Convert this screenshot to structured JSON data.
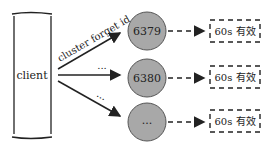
{
  "client": {
    "label": "client"
  },
  "arrows": [
    {
      "label": "cluster forget id"
    },
    {
      "label": "..."
    },
    {
      "label": "..."
    }
  ],
  "nodes": [
    {
      "label": "6379"
    },
    {
      "label": "6380"
    },
    {
      "label": "..."
    }
  ],
  "notes": [
    {
      "label": "60s 有效"
    },
    {
      "label": "60s 有效"
    },
    {
      "label": "60s 有效"
    }
  ],
  "colors": {
    "node_fill": "#a8a8a8",
    "node_stroke": "#555555",
    "line": "#222222"
  }
}
